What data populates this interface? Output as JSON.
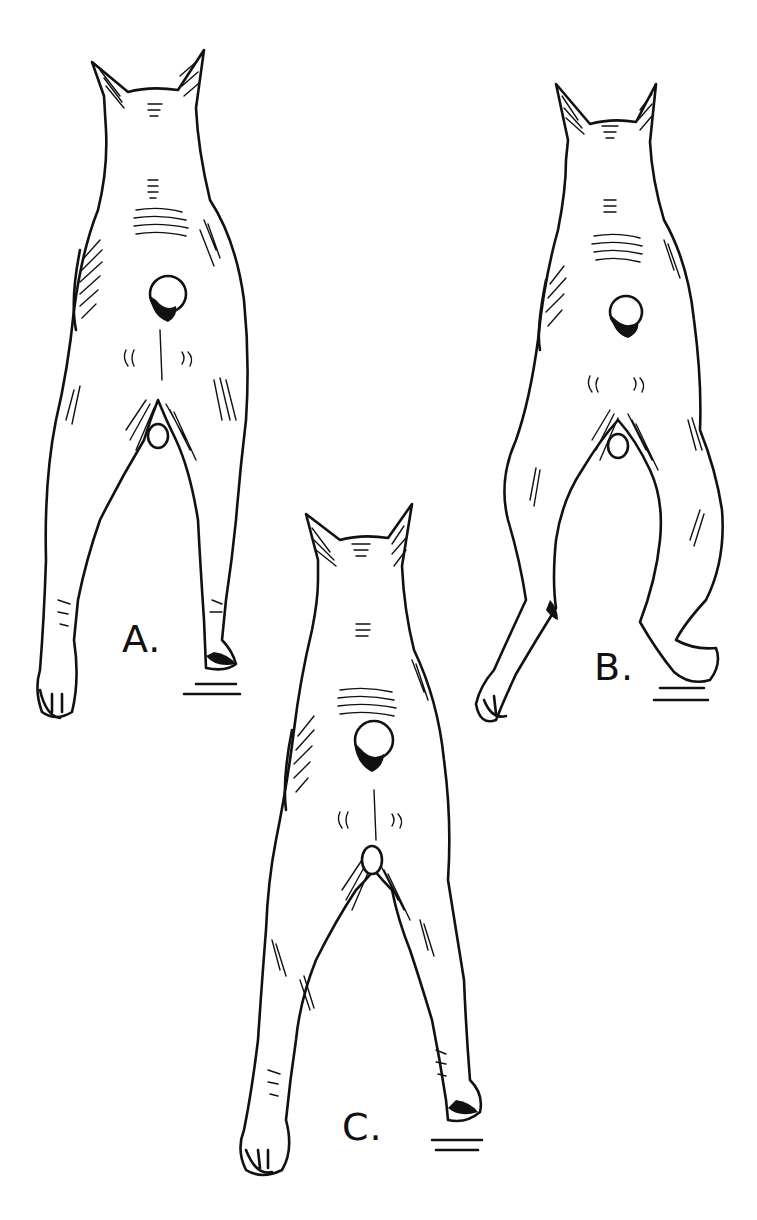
{
  "figure": {
    "ink_color": "#111111",
    "background_color": "#ffffff",
    "panels": [
      {
        "id": "A",
        "label": "A.",
        "stance": "straight parallel hind legs"
      },
      {
        "id": "B",
        "label": "B.",
        "stance": "cow-hocked / bowed hind legs"
      },
      {
        "id": "C",
        "label": "C.",
        "stance": "narrow, close hind legs"
      }
    ]
  }
}
